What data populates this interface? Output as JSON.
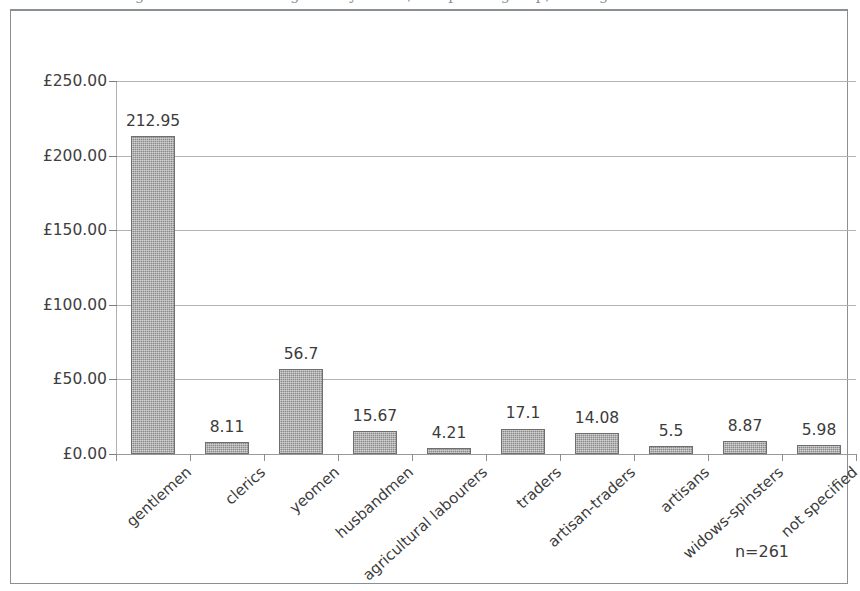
{
  "figure": {
    "caption_fragment": "Figure: mean value of goods by status/occupation group, borough of ...",
    "sample_note": "n=261"
  },
  "chart_data": {
    "type": "bar",
    "title": "",
    "subtitle": "",
    "xlabel": "",
    "ylabel": "",
    "categories": [
      "gentlemen",
      "clerics",
      "yeomen",
      "husbandmen",
      "agricultural labourers",
      "traders",
      "artisan-traders",
      "artisans",
      "widows-spinsters",
      "not specified"
    ],
    "values": [
      212.95,
      8.11,
      56.7,
      15.67,
      4.21,
      17.1,
      14.08,
      5.5,
      8.87,
      5.98
    ],
    "value_labels": [
      "212.95",
      "8.11",
      "56.7",
      "15.67",
      "4.21",
      "17.1",
      "14.08",
      "5.5",
      "8.87",
      "5.98"
    ],
    "ylim": [
      0,
      250
    ],
    "yticks": [
      0,
      50,
      100,
      150,
      200,
      250
    ],
    "ytick_labels": [
      "£0.00",
      "£50.00",
      "£100.00",
      "£150.00",
      "£200.00",
      "£250.00"
    ],
    "grid": true,
    "legend": false,
    "legend_position": "none",
    "annotations": [
      "n=261"
    ],
    "bar_color": "#8a8a8a",
    "gridline_color": "#b3b3b3",
    "axis_color": "#9a9a9a",
    "currency_symbol": "£"
  }
}
